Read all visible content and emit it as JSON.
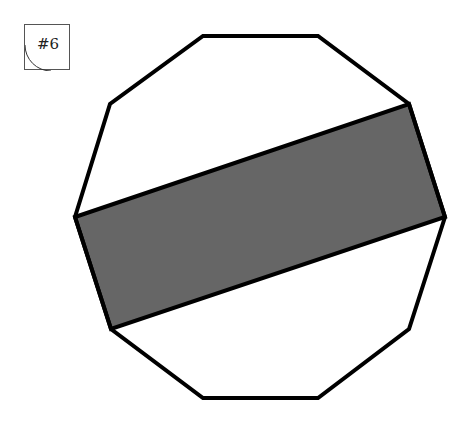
{
  "problem": {
    "label": "#6"
  },
  "figure": {
    "shape": "decagon",
    "outline_color": "#000000",
    "shaded_fill_color": "#666666",
    "background_color": "#ffffff"
  }
}
